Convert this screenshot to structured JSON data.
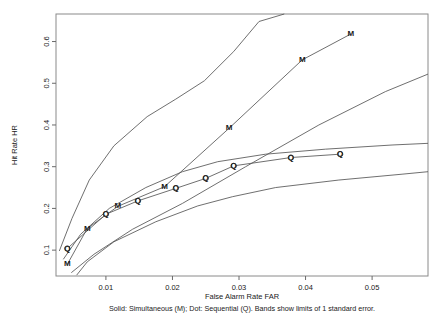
{
  "chart_data": {
    "type": "line",
    "title": "",
    "xlabel": "False Alarm Rate FAR",
    "ylabel": "Hit Rate HR",
    "caption": "Solid: Simultaneous (M); Dot: Sequential (Q). Bands show limits of 1 standard error.",
    "xlim": [
      0.0025,
      0.0584
    ],
    "ylim": [
      0.038,
      0.666
    ],
    "xticks": [
      0.01,
      0.02,
      0.03,
      0.04,
      0.05
    ],
    "xtick_labels": [
      "0.01",
      "0.02",
      "0.03",
      "0.04",
      "0.05"
    ],
    "yticks": [
      0.1,
      0.2,
      0.3,
      0.4,
      0.5,
      0.6
    ],
    "ytick_labels": [
      "0.1",
      "0.2",
      "0.3",
      "0.4",
      "0.5",
      "0.6"
    ],
    "grid": false,
    "legend_position": "none",
    "marker_glyphs": {
      "simultaneous": "M",
      "sequential": "Q"
    },
    "series": [
      {
        "name": "Simultaneous (M)",
        "marker": "M",
        "style": "solid",
        "role": "main",
        "x": [
          0.0042,
          0.0072,
          0.0118,
          0.0188,
          0.0285,
          0.0395,
          0.0468
        ],
        "y": [
          0.066,
          0.152,
          0.205,
          0.252,
          0.392,
          0.556,
          0.618
        ]
      },
      {
        "name": "Simultaneous upper band",
        "marker": "",
        "style": "solid",
        "role": "upper",
        "x": [
          0.003,
          0.0049,
          0.0075,
          0.0112,
          0.0162,
          0.0205,
          0.0248,
          0.0292,
          0.033,
          0.0368
        ],
        "y": [
          0.098,
          0.176,
          0.268,
          0.35,
          0.42,
          0.462,
          0.506,
          0.576,
          0.648,
          0.666
        ]
      },
      {
        "name": "Simultaneous lower band",
        "marker": "",
        "style": "solid",
        "role": "lower",
        "x": [
          0.0048,
          0.0082,
          0.014,
          0.0215,
          0.031,
          0.042,
          0.052,
          0.0584
        ],
        "y": [
          0.046,
          0.09,
          0.15,
          0.212,
          0.3,
          0.4,
          0.48,
          0.522
        ]
      },
      {
        "name": "Sequential (Q)",
        "marker": "Q",
        "style": "dot",
        "role": "main",
        "x": [
          0.0042,
          0.01,
          0.0148,
          0.0205,
          0.025,
          0.0292,
          0.0378,
          0.0452
        ],
        "y": [
          0.104,
          0.186,
          0.218,
          0.248,
          0.272,
          0.302,
          0.322,
          0.33
        ]
      },
      {
        "name": "Sequential upper band",
        "marker": "",
        "style": "solid",
        "role": "upper",
        "x": [
          0.0036,
          0.0062,
          0.0105,
          0.016,
          0.0215,
          0.0268,
          0.034,
          0.043,
          0.053,
          0.0584
        ],
        "y": [
          0.078,
          0.138,
          0.2,
          0.25,
          0.288,
          0.312,
          0.33,
          0.342,
          0.352,
          0.356
        ]
      },
      {
        "name": "Sequential lower band",
        "marker": "",
        "style": "solid",
        "role": "lower",
        "x": [
          0.0056,
          0.0072,
          0.0112,
          0.0175,
          0.0238,
          0.029,
          0.0355,
          0.045,
          0.0545,
          0.0584
        ],
        "y": [
          0.04,
          0.072,
          0.12,
          0.168,
          0.206,
          0.228,
          0.25,
          0.268,
          0.282,
          0.288
        ]
      }
    ]
  }
}
